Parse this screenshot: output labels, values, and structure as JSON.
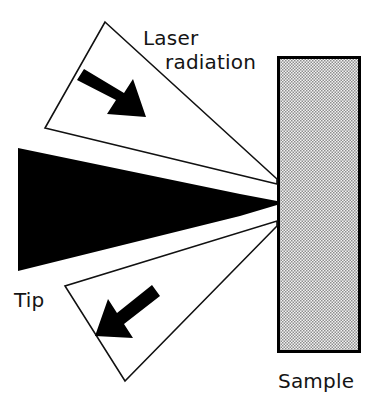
{
  "figure": {
    "type": "schematic-diagram",
    "background_color": "#ffffff",
    "ink_color": "#000000",
    "width": 372,
    "height": 407
  },
  "labels": {
    "laser_line1": "Laser",
    "laser_line2": "radiation",
    "tip": "Tip",
    "sample": "Sample"
  },
  "elements": {
    "tip": {
      "name": "Tip",
      "description": "Solid black wedge-shaped probe tip tapering to a point at the sample surface",
      "fill_color": "#000000",
      "points": "18,148 18,271 277,205 277,201"
    },
    "upper_beam": {
      "name": "Upper laser beam path",
      "description": "White quadrilateral beam cone coming down-right toward the tip apex",
      "fill_color": "#ffffff",
      "stroke_color": "#111111",
      "points": "105,22 277,179 277,184 45,128"
    },
    "lower_beam": {
      "name": "Lower laser beam path",
      "description": "White quadrilateral beam cone going down-left away from the tip apex",
      "fill_color": "#ffffff",
      "stroke_color": "#111111",
      "points": "277,221 277,226 125,381 65,286"
    },
    "sample": {
      "name": "Sample",
      "description": "Vertical rectangular slab with stippled/dithered gray fill and black border",
      "fill_color": "#d8d8d8",
      "stroke_color": "#000000",
      "x": 277,
      "y": 56,
      "width": 84,
      "height": 297
    },
    "upper_arrow": {
      "name": "Incoming beam direction arrow",
      "direction": "down-right",
      "fill_color": "#000000",
      "tail_x": 84,
      "tail_y": 74,
      "head_x": 142,
      "head_y": 113
    },
    "lower_arrow": {
      "name": "Outgoing beam direction arrow",
      "direction": "down-left",
      "fill_color": "#000000",
      "tail_x": 148,
      "tail_y": 288,
      "head_x": 100,
      "head_y": 328
    }
  },
  "label_positions": {
    "laser_line1": {
      "x": 143,
      "y": 45
    },
    "laser_line2": {
      "x": 165,
      "y": 69
    },
    "tip": {
      "x": 14,
      "y": 307
    },
    "sample": {
      "x": 278,
      "y": 388
    }
  }
}
